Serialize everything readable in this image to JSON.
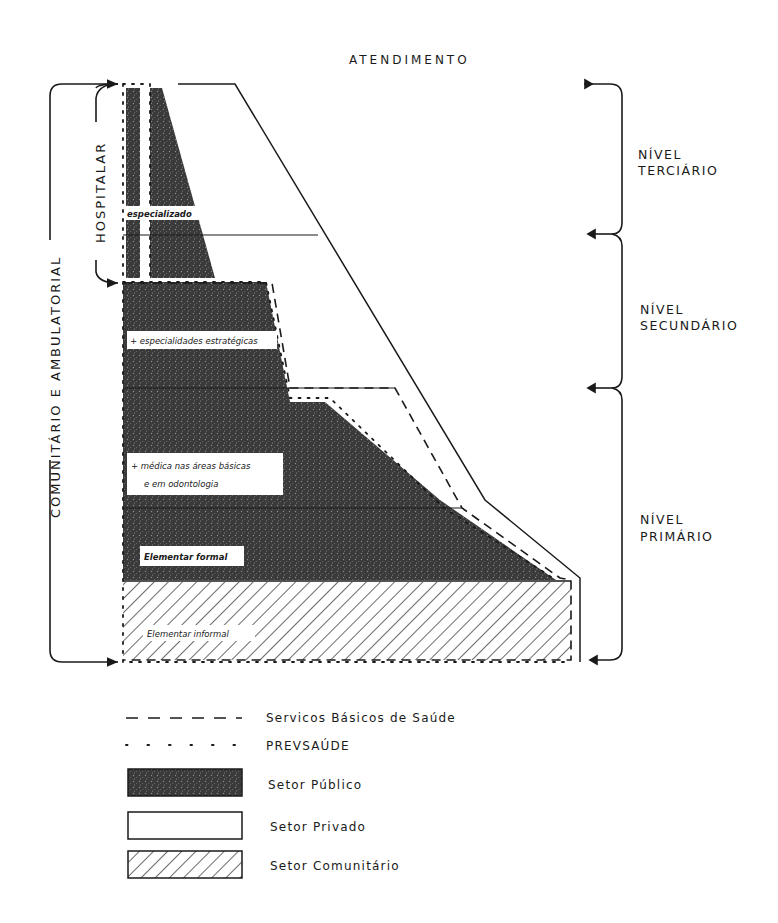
{
  "title": "ATENDIMENTO",
  "left_labels": {
    "outer": "COMUNITÁRIO E AMBULATORIAL",
    "inner": "HOSPITALAR"
  },
  "levels": [
    {
      "line1": "NÍVEL",
      "line2": "TERCIÁRIO"
    },
    {
      "line1": "NÍVEL",
      "line2": "SECUNDÁRIO"
    },
    {
      "line1": "NÍVEL",
      "line2": "PRIMÁRIO"
    }
  ],
  "boxes": {
    "especializado": "especializado",
    "especialidades": "+ especialidades estratégicas",
    "medica_line1": "+ médica nas áreas básicas",
    "medica_line2": "e em odontologia",
    "elementar_formal": "Elementar formal",
    "elementar_informal": "Elementar informal"
  },
  "legend": [
    {
      "style": "dashed",
      "label": "Servicos Básicos de Saúde"
    },
    {
      "style": "dotted",
      "label": "PREVSAÚDE"
    },
    {
      "style": "dark-fill",
      "label": "Setor Público"
    },
    {
      "style": "white-fill",
      "label": "Setor Privado"
    },
    {
      "style": "hatched",
      "label": "Setor Comunitário"
    }
  ],
  "colors": {
    "ink": "#1a1a1a",
    "public_sector": "#3a3a3a",
    "paper": "#ffffff"
  }
}
